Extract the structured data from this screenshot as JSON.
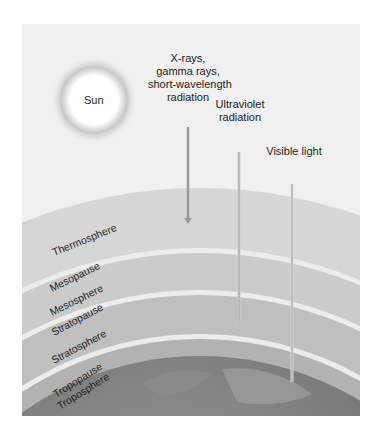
{
  "figure": {
    "sun_label": "Sun",
    "radiation": [
      {
        "label": "X-rays,\ngamma rays,\nshort-wavelength\nradiation",
        "lines": [
          "X-rays,",
          "gamma rays,",
          "short-wavelength",
          "radiation"
        ]
      },
      {
        "label": "Ultraviolet radiation",
        "lines": [
          "Ultraviolet",
          "radiation"
        ]
      },
      {
        "label": "Visible light",
        "lines": [
          "Visible light"
        ]
      }
    ],
    "layers": [
      "Thermosphere",
      "Mesopause",
      "Mesosphere",
      "Stratopause",
      "Stratosphere",
      "Tropopause",
      "Troposphere"
    ]
  },
  "colors": {
    "background": "#f0f0f0",
    "thermosphere": "#d4d4d4",
    "mesosphere": "#c9c9c9",
    "stratosphere": "#bcbcbc",
    "troposphere": "#b0b0b0",
    "pause_line": "#ececec",
    "earth": "#7a7a7a"
  }
}
